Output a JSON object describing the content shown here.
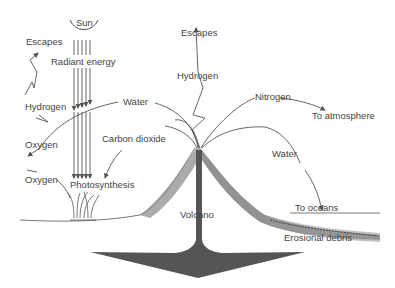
{
  "diagram": {
    "labels": {
      "sun": "Sun",
      "radiant_energy": "Radiant energy",
      "escapes_left": "Escapes",
      "hydrogen_left": "Hydrogen",
      "oxygen_upper": "Oxygen",
      "oxygen_lower": "Oxygen",
      "water_left": "Water",
      "carbon_dioxide": "Carbon dioxide",
      "photosynthesis": "Photosynthesis",
      "escapes_top": "Escapes",
      "hydrogen_top": "Hydrogen",
      "nitrogen": "Nitrogen",
      "to_atmosphere": "To atmosphere",
      "water_right": "Water",
      "to_oceans": "To oceans",
      "volcano": "Volcano",
      "erosional_debris": "Erosional debris"
    },
    "colors": {
      "line": "#555555",
      "text": "#444444",
      "magma": "#555555",
      "slope_dark": "#666666",
      "slope_light": "#aaaaaa"
    }
  }
}
